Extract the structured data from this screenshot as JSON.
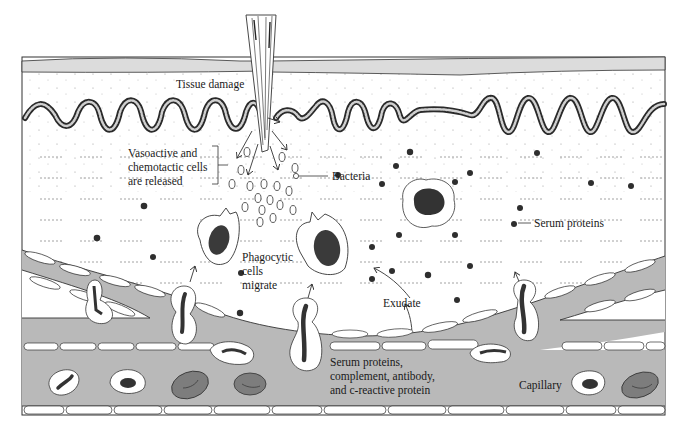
{
  "diagram": {
    "type": "anatomical-illustration",
    "colors": {
      "skin_layer": "#dcdcdc",
      "capillary": "#b9b9b9",
      "cell_nucleus": "#3a3a3a",
      "red_blood_cell": "#7d7d7d",
      "outline": "#222222",
      "tissue": "#ffffff"
    }
  },
  "labels": {
    "tissue_damage": "Tissue damage",
    "vasoactive_line1": "Vasoactive and",
    "vasoactive_line2": "chemotactic cells",
    "vasoactive_line3": "are released",
    "bacteria": "Bacteria",
    "serum_proteins": "Serum proteins",
    "phagocytic_line1": "Phagocytic",
    "phagocytic_line2": "cells",
    "phagocytic_line3": "migrate",
    "exudate": "Exudate",
    "serum_complex_line1": "Serum proteins,",
    "serum_complex_line2": "complement, antibody,",
    "serum_complex_line3": "and c-reactive protein",
    "capillary": "Capillary"
  }
}
